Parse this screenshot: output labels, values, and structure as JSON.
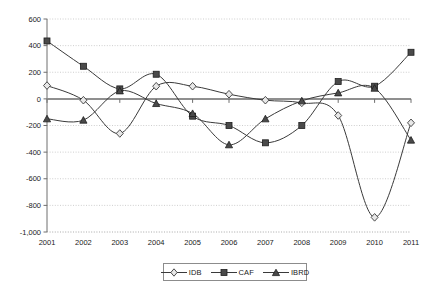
{
  "chart_data": {
    "type": "line",
    "title": "",
    "subtitle": "",
    "xlabel": "",
    "ylabel": "",
    "categories": [
      "2001",
      "2002",
      "2003",
      "2004",
      "2005",
      "2006",
      "2007",
      "2008",
      "2009",
      "2010",
      "2011"
    ],
    "x": [
      2001,
      2002,
      2003,
      2004,
      2005,
      2006,
      2007,
      2008,
      2009,
      2010,
      2011
    ],
    "ylim": [
      -1000,
      600
    ],
    "yticks": [
      600,
      400,
      200,
      0,
      -200,
      -400,
      -600,
      -800,
      -1000
    ],
    "ytick_labels": [
      "600",
      "400",
      "200",
      "0",
      "-200",
      "-400",
      "-600",
      "-800",
      "-1,000"
    ],
    "xtick_labels": [
      "2001",
      "2002",
      "2003",
      "2004",
      "2005",
      "2006",
      "2007",
      "2008",
      "2009",
      "2010",
      "2011"
    ],
    "grid": true,
    "grid_style": "dotted-horizontal",
    "zero_line": true,
    "smoothing": "spline",
    "legend_position": "bottom-center",
    "series": [
      {
        "name": "IDB",
        "marker": "diamond-open",
        "values": [
          100,
          -10,
          -260,
          95,
          95,
          35,
          -10,
          -30,
          -125,
          -890,
          -180
        ]
      },
      {
        "name": "CAF",
        "marker": "square-filled",
        "values": [
          435,
          245,
          75,
          185,
          -130,
          -200,
          -330,
          -200,
          130,
          95,
          350
        ]
      },
      {
        "name": "IBRD",
        "marker": "triangle-filled",
        "values": [
          -150,
          -160,
          60,
          -35,
          -110,
          -345,
          -150,
          -15,
          45,
          80,
          -310
        ]
      }
    ]
  },
  "legend": {
    "entries": [
      {
        "label": "IDB"
      },
      {
        "label": "CAF"
      },
      {
        "label": "IBRD"
      }
    ]
  },
  "colors": {
    "line": "#3a3a3a",
    "marker_fill": "#4a4a4a",
    "marker_open": "#e8e8e8",
    "grid": "#b9b9b9",
    "zero": "#8f8f8f",
    "axis": "#6e6e6e",
    "text": "#1a1a1a",
    "background": "#ffffff"
  }
}
